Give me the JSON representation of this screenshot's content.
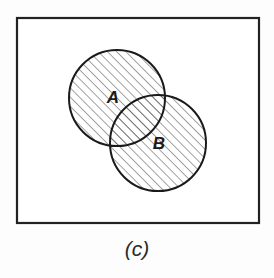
{
  "figure": {
    "caption": "(c)",
    "background_color": "#fdfdfd",
    "frame": {
      "name": "universal-set-rectangle",
      "x": 17,
      "y": 18,
      "width": 242,
      "height": 205,
      "stroke_color": "#222222",
      "stroke_width": 2.2,
      "fill_color": "#ffffff"
    },
    "sets": [
      {
        "label": "A",
        "cx": 117,
        "cy": 98,
        "r": 48,
        "label_x": 113,
        "label_y": 103,
        "stroke_color": "#1a1a1a",
        "stroke_width": 2.0,
        "shaded": true
      },
      {
        "label": "B",
        "cx": 158,
        "cy": 143,
        "r": 48,
        "label_x": 159,
        "label_y": 149,
        "stroke_color": "#1a1a1a",
        "stroke_width": 2.0,
        "shaded": true
      }
    ],
    "hatch": {
      "name": "diagonal-hatch-45",
      "angle_degrees": 45,
      "direction": "lower-left-to-upper-right",
      "spacing": 6.5,
      "line_width": 1.1,
      "line_color": "#555555"
    },
    "caption_position": {
      "x": 137,
      "y": 256
    }
  }
}
